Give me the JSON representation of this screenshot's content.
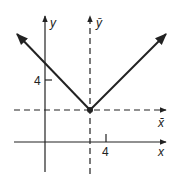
{
  "diagram": {
    "type": "graph of absolute value function with translated axes",
    "axes": {
      "original": {
        "x_label": "x",
        "y_label": "y"
      },
      "translated": {
        "x_label": "x̄",
        "y_label": "ȳ"
      }
    },
    "ticks": {
      "x_tick_label": "4",
      "y_tick_label": "4"
    },
    "vertex_marker": "filled dot at origin of translated axes"
  }
}
